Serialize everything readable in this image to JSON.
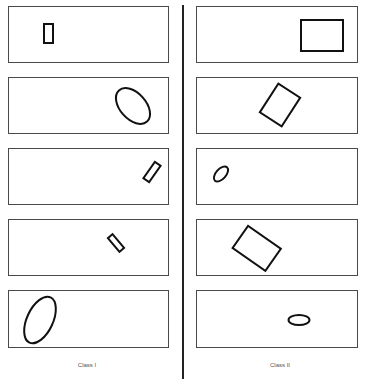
{
  "figure": {
    "columns": [
      {
        "label": "Class I"
      },
      {
        "label": "Class II"
      }
    ],
    "colors": {
      "panel_border": "#4a4a4a",
      "shape_stroke": "#111111",
      "divider": "#222222",
      "label_text": "#555555"
    },
    "class_1_panels": [
      {
        "shape": "rectangle",
        "size": "small",
        "orientation": "upright"
      },
      {
        "shape": "ellipse",
        "size": "medium",
        "orientation": "tilted"
      },
      {
        "shape": "rectangle",
        "size": "small",
        "orientation": "tilted"
      },
      {
        "shape": "rectangle",
        "size": "small",
        "orientation": "tilted"
      },
      {
        "shape": "ellipse",
        "size": "large",
        "orientation": "tilted"
      }
    ],
    "class_2_panels": [
      {
        "shape": "rectangle",
        "size": "large",
        "orientation": "upright"
      },
      {
        "shape": "rectangle",
        "size": "large",
        "orientation": "tilted"
      },
      {
        "shape": "ellipse",
        "size": "small",
        "orientation": "tilted"
      },
      {
        "shape": "rectangle",
        "size": "large",
        "orientation": "tilted"
      },
      {
        "shape": "ellipse",
        "size": "small",
        "orientation": "horizontal"
      }
    ]
  }
}
